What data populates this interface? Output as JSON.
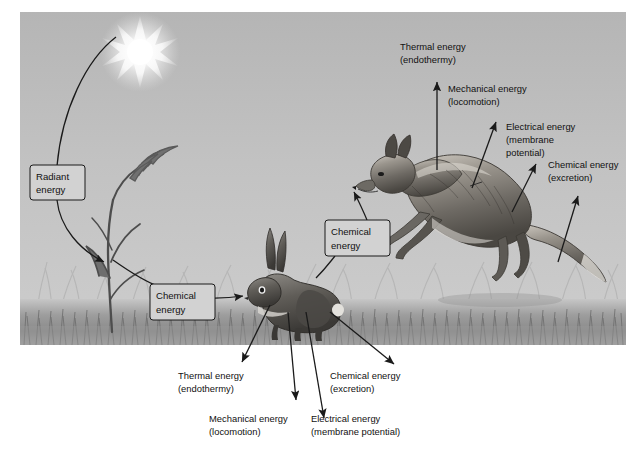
{
  "figure": {
    "scene_description": "Grayscale illustration of a sun, a grass plant, a rabbit, and a leaping fox on a grassy field, annotated with energy-transformation labels and arrows",
    "colors": {
      "page_background": "#ffffff",
      "sky_top": "#b9b9b9",
      "sky_bottom": "#cfcfcf",
      "grass_band": "#8e8e8e",
      "ground": "#a8a8a8",
      "sun": "#ffffff",
      "line": "#1a1a1a",
      "callout_fill": "#d2d2d2",
      "text": "#111111"
    }
  },
  "scene_objects": [
    {
      "name": "sun",
      "label": "sun"
    },
    {
      "name": "grass-plant",
      "label": "grass plant"
    },
    {
      "name": "rabbit",
      "label": "rabbit"
    },
    {
      "name": "fox",
      "label": "leaping fox"
    },
    {
      "name": "grass-field",
      "label": "grass field"
    }
  ],
  "callouts": [
    {
      "id": "radiant-energy",
      "line1": "Radiant",
      "line2": "energy",
      "sublabel": ""
    },
    {
      "id": "chemical-energy-plant",
      "line1": "Chemical",
      "line2": "energy",
      "sublabel": ""
    },
    {
      "id": "chemical-energy-rabbit",
      "line1": "Chemical",
      "line2": "energy",
      "sublabel": ""
    }
  ],
  "fox_labels": [
    {
      "id": "fox-thermal",
      "line1": "Thermal energy",
      "line2": "(endothermy)"
    },
    {
      "id": "fox-mechanical",
      "line1": "Mechanical energy",
      "line2": "(locomotion)"
    },
    {
      "id": "fox-electrical",
      "line1": "Electrical energy",
      "line2": "(membrane",
      "line3": "potential)"
    },
    {
      "id": "fox-chemical",
      "line1": "Chemical energy",
      "line2": "(excretion)"
    }
  ],
  "rabbit_labels": [
    {
      "id": "rabbit-thermal",
      "line1": "Thermal energy",
      "line2": "(endothermy)"
    },
    {
      "id": "rabbit-mechanical",
      "line1": "Mechanical energy",
      "line2": "(locomotion)"
    },
    {
      "id": "rabbit-electrical",
      "line1": "Electrical energy",
      "line2": "(membrane potential)"
    },
    {
      "id": "rabbit-chemical",
      "line1": "Chemical energy",
      "line2": "(excretion)"
    }
  ]
}
